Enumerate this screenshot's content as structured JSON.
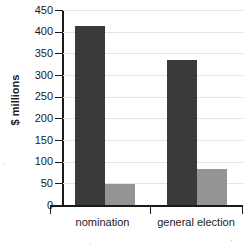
{
  "chart_data": {
    "type": "bar",
    "title": "",
    "xlabel": "",
    "ylabel": "$ millions",
    "ylim": [
      0,
      450
    ],
    "yticks": [
      0,
      50,
      100,
      150,
      200,
      250,
      300,
      350,
      400,
      450
    ],
    "ytick_labels": [
      "0",
      "50",
      "100",
      "150",
      "200",
      "250",
      "300",
      "350",
      "400",
      "450"
    ],
    "grid": true,
    "legend": "none",
    "categories": [
      "nomination",
      "general election"
    ],
    "series": [
      {
        "name": "series-1",
        "color": "#3a3a3a",
        "values": [
          412,
          335
        ]
      },
      {
        "name": "series-2",
        "color": "#949494",
        "values": [
          48,
          83
        ]
      }
    ]
  },
  "axis": {
    "y_title": "$ millions",
    "ticks": [
      {
        "label": "450",
        "value": 450
      },
      {
        "label": "400",
        "value": 400
      },
      {
        "label": "350",
        "value": 350
      },
      {
        "label": "300",
        "value": 300
      },
      {
        "label": "250",
        "value": 250
      },
      {
        "label": "200",
        "value": 200
      },
      {
        "label": "150",
        "value": 150
      },
      {
        "label": "100",
        "value": 100
      },
      {
        "label": "50",
        "value": 50
      },
      {
        "label": "0",
        "value": 0
      }
    ]
  },
  "categories": [
    {
      "label": "nomination"
    },
    {
      "label": "general election"
    }
  ]
}
